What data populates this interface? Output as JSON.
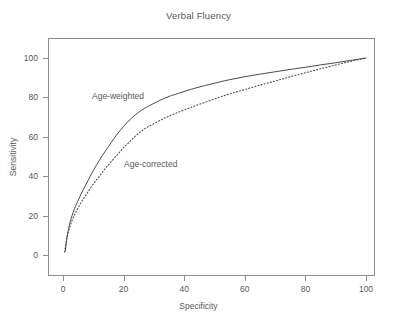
{
  "chart_data": {
    "type": "line",
    "title": "Verbal Fluency",
    "xlabel": "Specificity",
    "ylabel": "Sensitivity",
    "xlim": [
      0,
      100
    ],
    "ylim": [
      0,
      100
    ],
    "xticks": [
      0,
      20,
      40,
      60,
      80,
      100
    ],
    "yticks": [
      0,
      20,
      40,
      60,
      80,
      100
    ],
    "grid": false,
    "legend_position": "inline-annotations",
    "annotations": [
      {
        "text": "Age-weighted",
        "x": 11,
        "y": 84
      },
      {
        "text": "Age-corrected",
        "x": 22,
        "y": 50
      }
    ],
    "series": [
      {
        "name": "Age-weighted",
        "style": "solid",
        "color": "#4a4a4a",
        "x": [
          0.8,
          1.2,
          1.8,
          2.4,
          3.0,
          3.8,
          4.8,
          6.0,
          7.5,
          9.0,
          11.0,
          13.0,
          15.0,
          17.0,
          19.0,
          21.0,
          23.0,
          25.0,
          27.0,
          29.0,
          32.0,
          35.0,
          38.0,
          42.0,
          46.0,
          50.0,
          55.0,
          60.0,
          65.0,
          70.0,
          75.0,
          80.0,
          85.0,
          90.0,
          95.0,
          100.0
        ],
        "y": [
          2.0,
          8.0,
          13.0,
          17.0,
          20.0,
          23.5,
          27.0,
          31.0,
          35.5,
          40.0,
          45.5,
          50.5,
          55.0,
          59.5,
          63.5,
          67.0,
          70.0,
          72.5,
          74.5,
          76.2,
          78.5,
          80.5,
          82.0,
          84.0,
          85.7,
          87.2,
          89.0,
          90.5,
          91.8,
          93.0,
          94.2,
          95.3,
          96.5,
          97.6,
          98.8,
          100.0
        ]
      },
      {
        "name": "Age-corrected",
        "style": "dotted",
        "color": "#4a4a4a",
        "x": [
          0.5,
          1.0,
          1.5,
          2.2,
          3.0,
          4.0,
          5.2,
          6.5,
          8.0,
          10.0,
          12.0,
          14.0,
          16.0,
          18.0,
          20.0,
          22.0,
          24.0,
          26.0,
          28.0,
          31.0,
          34.0,
          37.0,
          41.0,
          45.0,
          50.0,
          55.0,
          60.0,
          65.0,
          70.0,
          75.0,
          80.0,
          85.0,
          90.0,
          95.0,
          100.0
        ],
        "y": [
          1.5,
          6.0,
          10.0,
          14.0,
          17.5,
          21.0,
          24.5,
          28.0,
          31.5,
          36.0,
          40.0,
          44.0,
          47.5,
          51.0,
          54.5,
          57.5,
          60.5,
          63.0,
          65.0,
          67.5,
          69.8,
          71.8,
          74.2,
          76.5,
          79.2,
          81.8,
          84.0,
          86.2,
          88.3,
          90.5,
          92.5,
          94.5,
          96.5,
          98.3,
          100.0
        ]
      }
    ]
  },
  "colors": {
    "background": "#ffffff",
    "frame": "#8e8e8e",
    "text": "#585858",
    "line": "#4a4a4a"
  }
}
